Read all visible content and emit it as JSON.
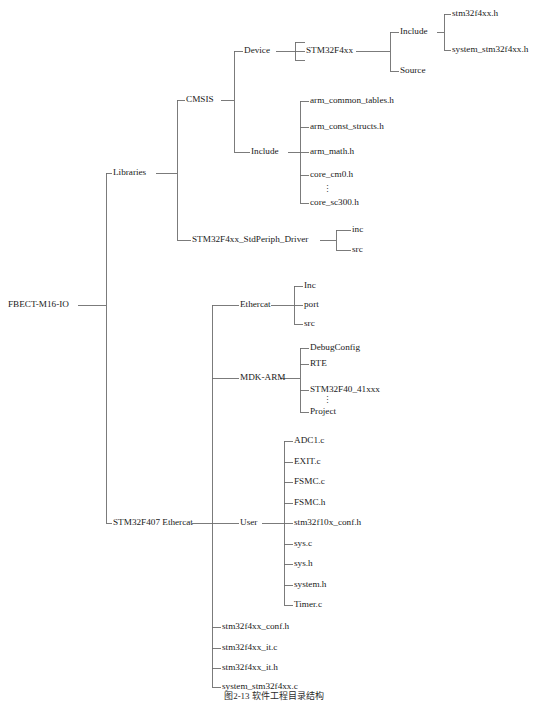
{
  "figure": {
    "root_label": "FBECT-M16-IO",
    "caption": "图2-13  软件工程目录结构",
    "line_color": "#6d6d6d",
    "text_color": "#1a1a1a",
    "background": "#ffffff",
    "ellipsis_glyph": "⋮"
  },
  "nodes": [
    {
      "id": "root",
      "label": "FBECT-M16-IO",
      "x": 8,
      "y": 305,
      "anchor": "start"
    },
    {
      "id": "libraries",
      "label": "Libraries",
      "x": 113,
      "y": 173,
      "anchor": "start"
    },
    {
      "id": "cmsis",
      "label": "CMSIS",
      "x": 186,
      "y": 100,
      "anchor": "start"
    },
    {
      "id": "device",
      "label": "Device",
      "x": 244,
      "y": 51,
      "anchor": "start"
    },
    {
      "id": "stm32f4xx",
      "label": "STM32F4xx",
      "x": 306,
      "y": 51,
      "anchor": "start"
    },
    {
      "id": "inc_dev",
      "label": "Include",
      "x": 400,
      "y": 32,
      "anchor": "start"
    },
    {
      "id": "src_dev",
      "label": "Source",
      "x": 400,
      "y": 71,
      "anchor": "start"
    },
    {
      "id": "f_stm32h",
      "label": "stm32f4xx.h",
      "x": 452,
      "y": 14,
      "anchor": "start"
    },
    {
      "id": "f_sysstm32h",
      "label": "system_stm32f4xx.h",
      "x": 452,
      "y": 50,
      "anchor": "start"
    },
    {
      "id": "inc_cmsis",
      "label": "Include",
      "x": 251,
      "y": 152,
      "anchor": "start"
    },
    {
      "id": "f_armtab",
      "label": "arm_common_tables.h",
      "x": 310,
      "y": 101,
      "anchor": "start"
    },
    {
      "id": "f_armconst",
      "label": "arm_const_structs.h",
      "x": 310,
      "y": 127,
      "anchor": "start"
    },
    {
      "id": "f_armmath",
      "label": "arm_math.h",
      "x": 310,
      "y": 152,
      "anchor": "start"
    },
    {
      "id": "f_corecm0",
      "label": "core_cm0.h",
      "x": 310,
      "y": 175,
      "anchor": "start"
    },
    {
      "id": "f_coresc300",
      "label": "core_sc300.h",
      "x": 310,
      "y": 203,
      "anchor": "start"
    },
    {
      "id": "stdperiph",
      "label": "STM32F4xx_StdPeriph_Driver",
      "x": 192,
      "y": 240,
      "anchor": "start"
    },
    {
      "id": "d_inc",
      "label": "inc",
      "x": 352,
      "y": 230,
      "anchor": "start"
    },
    {
      "id": "d_src",
      "label": "src",
      "x": 352,
      "y": 250,
      "anchor": "start"
    },
    {
      "id": "f407",
      "label": "STM32F407 Ethercat",
      "x": 113,
      "y": 523,
      "anchor": "start"
    },
    {
      "id": "ethercat",
      "label": "Ethercat",
      "x": 240,
      "y": 305,
      "anchor": "start"
    },
    {
      "id": "e_inc",
      "label": "Inc",
      "x": 304,
      "y": 286,
      "anchor": "start"
    },
    {
      "id": "e_port",
      "label": "port",
      "x": 304,
      "y": 305,
      "anchor": "start"
    },
    {
      "id": "e_src",
      "label": "src",
      "x": 304,
      "y": 324,
      "anchor": "start"
    },
    {
      "id": "mdkarm",
      "label": "MDK-ARM",
      "x": 240,
      "y": 378,
      "anchor": "start"
    },
    {
      "id": "m_debug",
      "label": "DebugConfig",
      "x": 310,
      "y": 348,
      "anchor": "start"
    },
    {
      "id": "m_rte",
      "label": "RTE",
      "x": 310,
      "y": 364,
      "anchor": "start"
    },
    {
      "id": "m_stm32f40",
      "label": "STM32F40_41xxx",
      "x": 310,
      "y": 390,
      "anchor": "start"
    },
    {
      "id": "m_project",
      "label": "Project",
      "x": 310,
      "y": 412,
      "anchor": "start"
    },
    {
      "id": "user",
      "label": "User",
      "x": 240,
      "y": 523,
      "anchor": "start"
    },
    {
      "id": "u_adc1",
      "label": "ADC1.c",
      "x": 294,
      "y": 441,
      "anchor": "start"
    },
    {
      "id": "u_exit",
      "label": "EXIT.c",
      "x": 294,
      "y": 462,
      "anchor": "start"
    },
    {
      "id": "u_fsmcc",
      "label": "FSMC.c",
      "x": 294,
      "y": 482,
      "anchor": "start"
    },
    {
      "id": "u_fsmch",
      "label": "FSMC.h",
      "x": 294,
      "y": 503,
      "anchor": "start"
    },
    {
      "id": "u_conf10x",
      "label": "stm32f10x_conf.h",
      "x": 294,
      "y": 523,
      "anchor": "start"
    },
    {
      "id": "u_sysc",
      "label": "sys.c",
      "x": 294,
      "y": 544,
      "anchor": "start"
    },
    {
      "id": "u_sysh",
      "label": "sys.h",
      "x": 294,
      "y": 564,
      "anchor": "start"
    },
    {
      "id": "u_systemh",
      "label": "system.h",
      "x": 294,
      "y": 585,
      "anchor": "start"
    },
    {
      "id": "u_timerc",
      "label": "Timer.c",
      "x": 294,
      "y": 605,
      "anchor": "start"
    },
    {
      "id": "r_conf",
      "label": "stm32f4xx_conf.h",
      "x": 222,
      "y": 627,
      "anchor": "start"
    },
    {
      "id": "r_itc",
      "label": "stm32f4xx_it.c",
      "x": 222,
      "y": 648,
      "anchor": "start"
    },
    {
      "id": "r_ith",
      "label": "stm32f4xx_it.h",
      "x": 222,
      "y": 668,
      "anchor": "start"
    },
    {
      "id": "r_sysc",
      "label": "system_stm32f4xx.c",
      "x": 222,
      "y": 687,
      "anchor": "start"
    }
  ],
  "ellipses": [
    {
      "id": "ell-cmsis-core",
      "x": 327,
      "y": 190
    },
    {
      "id": "ell-mdk-proj",
      "x": 327,
      "y": 401
    }
  ],
  "edges": [
    {
      "id": "root-stub",
      "d": "M 78 305 H 106"
    },
    {
      "id": "root-spine",
      "d": "M 106 173 V 523"
    },
    {
      "id": "root-to-lib",
      "d": "M 106 173 H 112"
    },
    {
      "id": "root-to-f407",
      "d": "M 106 523 H 112"
    },
    {
      "id": "lib-stub",
      "d": "M 156 173 H 177"
    },
    {
      "id": "lib-spine",
      "d": "M 177 100 V 240"
    },
    {
      "id": "lib-to-cmsis",
      "d": "M 177 100 H 185"
    },
    {
      "id": "lib-to-std",
      "d": "M 177 240 H 191"
    },
    {
      "id": "cmsis-stub",
      "d": "M 221 100 H 234"
    },
    {
      "id": "cmsis-spine",
      "d": "M 234 51 V 152"
    },
    {
      "id": "cmsis-to-dev",
      "d": "M 234 51 H 243"
    },
    {
      "id": "cmsis-to-inc",
      "d": "M 234 152 H 250"
    },
    {
      "id": "dev-stub",
      "d": "M 276 51 H 295"
    },
    {
      "id": "dev-bracket",
      "d": "M 295 42 V 60"
    },
    {
      "id": "dev-to-top",
      "d": "M 295 42 H 305"
    },
    {
      "id": "dev-to-bot",
      "d": "M 295 60 H 305"
    },
    {
      "id": "dev-mid",
      "d": "M 295 51 H 305"
    },
    {
      "id": "f4xx-stub",
      "d": "M 356 51 H 390"
    },
    {
      "id": "f4xx-spine",
      "d": "M 390 32 V 71"
    },
    {
      "id": "f4xx-to-inc",
      "d": "M 390 32 H 399"
    },
    {
      "id": "f4xx-to-src",
      "d": "M 390 71 H 399"
    },
    {
      "id": "incdev-stub",
      "d": "M 437 32 H 444"
    },
    {
      "id": "incdev-spine",
      "d": "M 444 14 V 50"
    },
    {
      "id": "incdev-to-h1",
      "d": "M 444 14 H 451"
    },
    {
      "id": "incdev-to-h2",
      "d": "M 444 50 H 451"
    },
    {
      "id": "inccm-stub",
      "d": "M 288 152 H 300"
    },
    {
      "id": "inccm-spine",
      "d": "M 300 101 V 203"
    },
    {
      "id": "inccm-to-1",
      "d": "M 300 101 H 309"
    },
    {
      "id": "inccm-to-2",
      "d": "M 300 127 H 309"
    },
    {
      "id": "inccm-to-3",
      "d": "M 300 152 H 309"
    },
    {
      "id": "inccm-to-4",
      "d": "M 300 175 H 309"
    },
    {
      "id": "inccm-to-5",
      "d": "M 300 203 H 309"
    },
    {
      "id": "std-stub",
      "d": "M 320 240 H 336"
    },
    {
      "id": "std-spine",
      "d": "M 336 230 V 250"
    },
    {
      "id": "std-to-inc",
      "d": "M 336 230 H 351"
    },
    {
      "id": "std-to-src",
      "d": "M 336 250 H 351"
    },
    {
      "id": "f407-stub",
      "d": "M 192 523 H 212"
    },
    {
      "id": "f407-spine",
      "d": "M 212 305 V 687"
    },
    {
      "id": "f407-to-eth",
      "d": "M 212 305 H 239"
    },
    {
      "id": "f407-to-mdk",
      "d": "M 212 378 H 239"
    },
    {
      "id": "f407-to-user",
      "d": "M 212 523 H 239"
    },
    {
      "id": "f407-to-conf",
      "d": "M 212 627 H 221"
    },
    {
      "id": "f407-to-itc",
      "d": "M 212 648 H 221"
    },
    {
      "id": "f407-to-ith",
      "d": "M 212 668 H 221"
    },
    {
      "id": "f407-to-sysc",
      "d": "M 212 687 H 221"
    },
    {
      "id": "eth-stub",
      "d": "M 271 305 H 294"
    },
    {
      "id": "eth-spine",
      "d": "M 294 286 V 324"
    },
    {
      "id": "eth-to-inc",
      "d": "M 294 286 H 303"
    },
    {
      "id": "eth-to-port",
      "d": "M 294 305 H 303"
    },
    {
      "id": "eth-to-src",
      "d": "M 294 324 H 303"
    },
    {
      "id": "mdk-stub",
      "d": "M 280 378 H 300"
    },
    {
      "id": "mdk-spine",
      "d": "M 300 348 V 412"
    },
    {
      "id": "mdk-to-debug",
      "d": "M 300 348 H 309"
    },
    {
      "id": "mdk-to-rte",
      "d": "M 300 364 H 309"
    },
    {
      "id": "mdk-to-f40",
      "d": "M 300 390 H 309"
    },
    {
      "id": "mdk-to-proj",
      "d": "M 300 412 H 309"
    },
    {
      "id": "user-stub",
      "d": "M 262 523 H 284"
    },
    {
      "id": "user-spine",
      "d": "M 284 441 V 605"
    },
    {
      "id": "user-to-1",
      "d": "M 284 441 H 293"
    },
    {
      "id": "user-to-2",
      "d": "M 284 462 H 293"
    },
    {
      "id": "user-to-3",
      "d": "M 284 482 H 293"
    },
    {
      "id": "user-to-4",
      "d": "M 284 503 H 293"
    },
    {
      "id": "user-to-5",
      "d": "M 284 523 H 293"
    },
    {
      "id": "user-to-6",
      "d": "M 284 544 H 293"
    },
    {
      "id": "user-to-7",
      "d": "M 284 564 H 293"
    },
    {
      "id": "user-to-8",
      "d": "M 284 585 H 293"
    },
    {
      "id": "user-to-9",
      "d": "M 284 605 H 293"
    }
  ]
}
